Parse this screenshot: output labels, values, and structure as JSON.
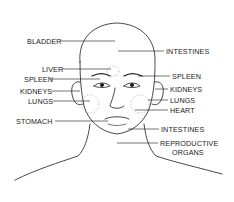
{
  "diagram": {
    "colors": {
      "ink": "#1a1a1a",
      "zone": "#9a9a9a",
      "background": "#ffffff"
    },
    "labels_left": [
      {
        "text": "BLADDER",
        "x": 27,
        "y": 38
      },
      {
        "text": "LIVER",
        "x": 42,
        "y": 66
      },
      {
        "text": "SPLEEN",
        "x": 24,
        "y": 76
      },
      {
        "text": "KIDNEYS",
        "x": 20,
        "y": 88
      },
      {
        "text": "LUNGS",
        "x": 28,
        "y": 98
      },
      {
        "text": "STOMACH",
        "x": 16,
        "y": 118
      }
    ],
    "labels_right": [
      {
        "text": "INTESTINES",
        "x": 166,
        "y": 48
      },
      {
        "text": "SPLEEN",
        "x": 172,
        "y": 73
      },
      {
        "text": "KIDNEYS",
        "x": 170,
        "y": 86
      },
      {
        "text": "LUNGS",
        "x": 170,
        "y": 97
      },
      {
        "text": "HEART",
        "x": 170,
        "y": 107
      },
      {
        "text": "INTESTINES",
        "x": 161,
        "y": 126
      },
      {
        "text": "REPRODUCTIVE",
        "x": 160,
        "y": 140
      },
      {
        "text": "ORGANS",
        "x": 172,
        "y": 149
      }
    ]
  }
}
